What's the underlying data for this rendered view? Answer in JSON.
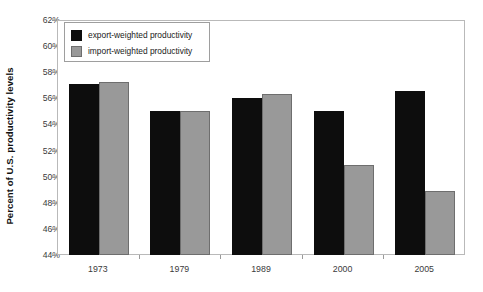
{
  "chart_data": {
    "type": "bar",
    "title": "",
    "xlabel": "",
    "ylabel": "Percent of U.S. productivity levels",
    "ylim": [
      44,
      62
    ],
    "ytick_step": 2,
    "ytick_labels": [
      "62%",
      "60%",
      "58%",
      "56%",
      "54%",
      "52%",
      "50%",
      "48%",
      "46%",
      "44%"
    ],
    "ytick_values": [
      62,
      60,
      58,
      56,
      54,
      52,
      50,
      48,
      46,
      44
    ],
    "grid": false,
    "legend_position": "top-left",
    "categories": [
      "1973",
      "1979",
      "1989",
      "2000",
      "2005"
    ],
    "series": [
      {
        "name": "export-weighted productivity",
        "color": "#0d0d0d",
        "values": [
          57.2,
          55.1,
          56.1,
          55.1,
          56.65
        ]
      },
      {
        "name": "import-weighted productivity",
        "color": "#999999",
        "values": [
          57.35,
          55.1,
          56.4,
          51.0,
          49.0
        ]
      }
    ]
  },
  "legend": {
    "items": [
      {
        "label": "export-weighted productivity",
        "swatch": "export"
      },
      {
        "label": "import-weighted productivity",
        "swatch": "import"
      }
    ]
  }
}
